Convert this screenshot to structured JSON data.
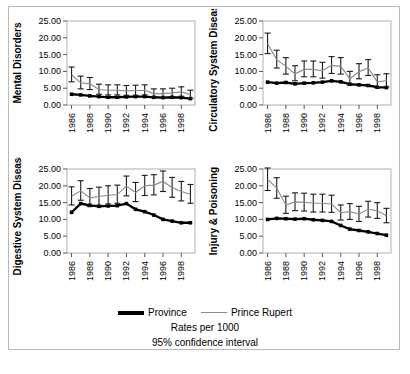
{
  "legend": {
    "province_label": "Province",
    "prince_rupert_label": "Prince Rupert",
    "rates_caption": "Rates per 1000",
    "ci_caption": "95% confidence interval"
  },
  "colors": {
    "province": "#000000",
    "prince_rupert": "#8a8a8a",
    "frame": "#b9b9b9",
    "plot_border": "#b0b0b0"
  },
  "bottom_caption": "",
  "chart_data": [
    {
      "type": "line",
      "title": "",
      "ylabel": "Mental Disorders",
      "xlabel": "",
      "ylim": [
        0,
        25
      ],
      "yticks": [
        0,
        5,
        10,
        15,
        20,
        25
      ],
      "ytick_labels": [
        "0.00",
        "5.00",
        "10.00",
        "15.00",
        "20.00",
        "25.00"
      ],
      "x": [
        1986,
        1987,
        1988,
        1989,
        1990,
        1991,
        1992,
        1993,
        1994,
        1995,
        1996,
        1997,
        1998,
        1999
      ],
      "xtick_labels": [
        "1986",
        "1988",
        "1990",
        "1992",
        "1994",
        "1996",
        "1998"
      ],
      "grid": false,
      "legend_position": "below-figure",
      "series": [
        {
          "name": "Province",
          "values": [
            3.2,
            3.0,
            2.7,
            2.5,
            2.3,
            2.3,
            2.4,
            2.5,
            2.5,
            2.3,
            2.2,
            2.3,
            2.2,
            1.9
          ]
        },
        {
          "name": "Prince Rupert",
          "values": [
            9.0,
            6.6,
            6.3,
            4.6,
            4.4,
            4.4,
            4.2,
            4.3,
            4.4,
            3.4,
            3.4,
            3.6,
            3.9,
            3.1
          ],
          "ci_low": [
            6.9,
            4.8,
            4.6,
            3.2,
            3.0,
            3.0,
            2.9,
            2.9,
            3.0,
            2.2,
            2.2,
            2.4,
            2.6,
            2.0
          ],
          "ci_high": [
            11.3,
            8.6,
            8.2,
            6.2,
            6.0,
            6.0,
            5.8,
            5.9,
            6.0,
            4.8,
            4.8,
            5.0,
            5.4,
            4.4
          ]
        }
      ]
    },
    {
      "type": "line",
      "title": "",
      "ylabel": "Circulatory System Diseases",
      "xlabel": "",
      "ylim": [
        0,
        25
      ],
      "yticks": [
        0,
        5,
        10,
        15,
        20,
        25
      ],
      "ytick_labels": [
        "0.00",
        "5.00",
        "10.00",
        "15.00",
        "20.00",
        "25.00"
      ],
      "x": [
        1986,
        1987,
        1988,
        1989,
        1990,
        1991,
        1992,
        1993,
        1994,
        1995,
        1996,
        1997,
        1998,
        1999
      ],
      "xtick_labels": [
        "1986",
        "1988",
        "1990",
        "1992",
        "1994",
        "1996",
        "1998"
      ],
      "grid": false,
      "legend_position": "below-figure",
      "series": [
        {
          "name": "Province",
          "values": [
            6.8,
            6.5,
            6.7,
            6.3,
            6.5,
            6.6,
            6.8,
            7.2,
            6.9,
            6.2,
            6.0,
            5.8,
            5.3,
            5.2
          ]
        },
        {
          "name": "Prince Rupert",
          "values": [
            18.2,
            13.5,
            11.5,
            9.3,
            10.6,
            10.6,
            10.2,
            11.8,
            11.5,
            7.8,
            9.9,
            11.0,
            6.9,
            7.2
          ],
          "ci_low": [
            15.3,
            11.0,
            9.2,
            7.2,
            8.4,
            8.4,
            8.0,
            9.4,
            9.2,
            5.9,
            7.8,
            8.8,
            5.1,
            5.4
          ],
          "ci_high": [
            21.4,
            16.3,
            14.1,
            11.7,
            13.1,
            13.1,
            12.7,
            14.4,
            14.1,
            10.0,
            12.3,
            13.5,
            9.0,
            9.3
          ]
        }
      ]
    },
    {
      "type": "line",
      "title": "",
      "ylabel": "Digestive System Diseases",
      "xlabel": "",
      "ylim": [
        0,
        25
      ],
      "yticks": [
        0,
        5,
        10,
        15,
        20,
        25
      ],
      "ytick_labels": [
        "0.00",
        "5.00",
        "10.00",
        "15.00",
        "20.00",
        "25.00"
      ],
      "x": [
        1986,
        1987,
        1988,
        1989,
        1990,
        1991,
        1992,
        1993,
        1994,
        1995,
        1996,
        1997,
        1998,
        1999
      ],
      "xtick_labels": [
        "1986",
        "1988",
        "1990",
        "1992",
        "1994",
        "1996",
        "1998"
      ],
      "grid": false,
      "legend_position": "below-figure",
      "series": [
        {
          "name": "Province",
          "values": [
            12.1,
            14.7,
            14.2,
            13.9,
            14.0,
            14.1,
            14.7,
            13.0,
            12.3,
            11.3,
            10.0,
            9.5,
            9.0,
            9.0
          ]
        },
        {
          "name": "Prince Rupert",
          "values": [
            16.9,
            18.5,
            16.4,
            16.8,
            17.2,
            17.4,
            19.9,
            18.0,
            20.0,
            20.2,
            21.3,
            19.5,
            18.3,
            17.5
          ],
          "ci_low": [
            14.3,
            15.7,
            13.8,
            14.2,
            14.6,
            14.8,
            17.0,
            15.3,
            17.1,
            17.3,
            18.3,
            16.6,
            15.5,
            14.8
          ],
          "ci_high": [
            19.7,
            21.5,
            19.2,
            19.6,
            20.0,
            20.2,
            22.9,
            21.0,
            23.1,
            23.3,
            24.4,
            22.5,
            21.3,
            20.4
          ]
        }
      ]
    },
    {
      "type": "line",
      "title": "",
      "ylabel": "Injury & Poisoning",
      "xlabel": "",
      "ylim": [
        0,
        25
      ],
      "yticks": [
        0,
        5,
        10,
        15,
        20,
        25
      ],
      "ytick_labels": [
        "0.00",
        "5.00",
        "10.00",
        "15.00",
        "20.00",
        "25.00"
      ],
      "x": [
        1986,
        1987,
        1988,
        1989,
        1990,
        1991,
        1992,
        1993,
        1994,
        1995,
        1996,
        1997,
        1998,
        1999
      ],
      "xtick_labels": [
        "1986",
        "1988",
        "1990",
        "1992",
        "1994",
        "1996",
        "1998"
      ],
      "grid": false,
      "legend_position": "below-figure",
      "series": [
        {
          "name": "Province",
          "values": [
            10.0,
            10.3,
            10.2,
            10.1,
            10.2,
            9.9,
            9.7,
            9.4,
            8.2,
            7.1,
            6.7,
            6.3,
            5.8,
            5.3
          ]
        },
        {
          "name": "Prince Rupert",
          "values": [
            21.9,
            19.3,
            14.3,
            15.2,
            15.1,
            14.8,
            14.8,
            14.6,
            12.0,
            12.3,
            11.6,
            13.0,
            12.6,
            11.1
          ],
          "ci_low": [
            18.6,
            16.3,
            11.8,
            12.6,
            12.5,
            12.2,
            12.2,
            12.1,
            9.8,
            10.0,
            9.4,
            10.7,
            10.3,
            9.0
          ],
          "ci_high": [
            25.3,
            22.4,
            16.9,
            17.9,
            17.8,
            17.5,
            17.5,
            17.2,
            14.3,
            14.7,
            13.9,
            15.4,
            15.0,
            13.3
          ]
        }
      ]
    }
  ]
}
